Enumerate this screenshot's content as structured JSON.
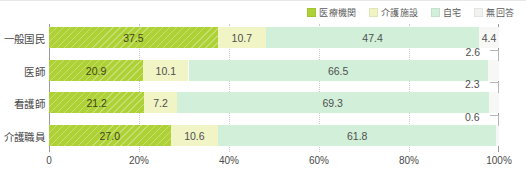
{
  "chart_data": {
    "type": "bar",
    "orientation": "horizontal",
    "stacked": true,
    "normalized_percent": true,
    "title": "",
    "xlabel": "",
    "ylabel": "",
    "xlim": [
      0,
      100
    ],
    "grid": true,
    "legend_position": "top-right",
    "categories": [
      "一般国民",
      "医師",
      "看護師",
      "介護職員"
    ],
    "tick_labels": [
      "0",
      "20%",
      "40%",
      "60%",
      "80%",
      "100%"
    ],
    "tick_values": [
      0,
      20,
      40,
      60,
      80,
      100
    ],
    "series": [
      {
        "name": "医療機関",
        "color": "#aed136",
        "values": [
          37.5,
          20.9,
          21.2,
          27.0
        ],
        "labels": [
          "37.5",
          "20.9",
          "21.2",
          "27.0"
        ]
      },
      {
        "name": "介護施設",
        "color": "#f1f4c4",
        "values": [
          10.7,
          10.1,
          7.2,
          10.6
        ],
        "labels": [
          "10.7",
          "10.1",
          "7.2",
          "10.6"
        ]
      },
      {
        "name": "自宅",
        "color": "#d2f0d9",
        "values": [
          47.4,
          66.5,
          69.3,
          61.8
        ],
        "labels": [
          "47.4",
          "66.5",
          "69.3",
          "61.8"
        ]
      },
      {
        "name": "無回答",
        "color": "#f7f7f5",
        "values": [
          4.4,
          2.6,
          2.3,
          0.6
        ],
        "labels": [
          "4.4",
          "2.6",
          "2.3",
          "0.6"
        ],
        "label_placement": [
          "inside",
          "callout",
          "callout",
          "callout"
        ]
      }
    ]
  },
  "legend": {
    "items": [
      {
        "label": "医療機関",
        "color": "#aed136"
      },
      {
        "label": "介護施設",
        "color": "#f1f4c4"
      },
      {
        "label": "自宅",
        "color": "#d2f0d9"
      },
      {
        "label": "無回答",
        "color": "#f2f2f0"
      }
    ]
  }
}
